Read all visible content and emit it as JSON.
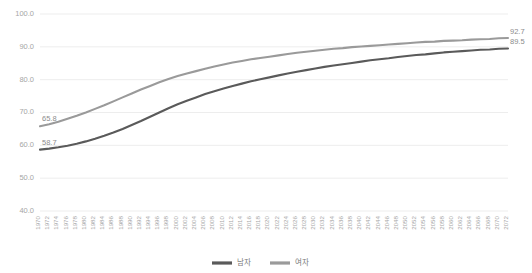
{
  "chart_data": {
    "type": "line",
    "title": "",
    "xlabel": "",
    "ylabel": "",
    "grid": true,
    "legend_position": "bottom-center",
    "ylim": [
      40.0,
      100.0
    ],
    "ytick_labels": [
      "100.0",
      "90.0",
      "80.0",
      "70.0",
      "60.0",
      "50.0",
      "40.0"
    ],
    "ytick_values": [
      100.0,
      90.0,
      80.0,
      70.0,
      60.0,
      50.0,
      40.0
    ],
    "xlim": [
      1970,
      2072
    ],
    "x": [
      1970,
      1972,
      1974,
      1976,
      1978,
      1980,
      1982,
      1984,
      1986,
      1988,
      1990,
      1992,
      1994,
      1996,
      1998,
      2000,
      2002,
      2004,
      2006,
      2008,
      2010,
      2012,
      2014,
      2016,
      2018,
      2020,
      2022,
      2024,
      2026,
      2028,
      2030,
      2032,
      2034,
      2036,
      2038,
      2040,
      2042,
      2044,
      2046,
      2048,
      2050,
      2052,
      2054,
      2056,
      2058,
      2060,
      2062,
      2064,
      2066,
      2068,
      2070,
      2072
    ],
    "xtick_labels": [
      "1970",
      "1972",
      "1974",
      "1976",
      "1978",
      "1980",
      "1982",
      "1984",
      "1986",
      "1988",
      "1990",
      "1992",
      "1994",
      "1996",
      "1998",
      "2000",
      "2002",
      "2004",
      "2006",
      "2008",
      "2010",
      "2012",
      "2014",
      "2016",
      "2018",
      "2020",
      "2022",
      "2024",
      "2026",
      "2028",
      "2030",
      "2032",
      "2034",
      "2036",
      "2038",
      "2040",
      "2042",
      "2044",
      "2046",
      "2048",
      "2050",
      "2052",
      "2054",
      "2056",
      "2058",
      "2060",
      "2062",
      "2064",
      "2066",
      "2068",
      "2070",
      "2072"
    ],
    "series": [
      {
        "name": "여자",
        "color": "#9a9a9a",
        "start_label": "65.8",
        "end_label": "92.7",
        "values": [
          65.8,
          66.4,
          67.2,
          68.1,
          69.0,
          70.0,
          71.1,
          72.2,
          73.4,
          74.6,
          75.8,
          77.0,
          78.1,
          79.2,
          80.2,
          81.1,
          81.9,
          82.6,
          83.3,
          84.0,
          84.6,
          85.2,
          85.7,
          86.2,
          86.6,
          87.0,
          87.4,
          87.8,
          88.2,
          88.5,
          88.8,
          89.1,
          89.4,
          89.6,
          89.9,
          90.1,
          90.3,
          90.5,
          90.7,
          90.9,
          91.1,
          91.3,
          91.5,
          91.6,
          91.8,
          91.9,
          92.0,
          92.2,
          92.3,
          92.4,
          92.6,
          92.7
        ]
      },
      {
        "name": "남자",
        "color": "#5a5a5a",
        "start_label": "58.7",
        "end_label": "89.5",
        "values": [
          58.7,
          59.0,
          59.4,
          59.9,
          60.5,
          61.2,
          62.0,
          62.9,
          63.9,
          65.0,
          66.2,
          67.4,
          68.7,
          70.0,
          71.3,
          72.5,
          73.6,
          74.6,
          75.6,
          76.5,
          77.3,
          78.1,
          78.8,
          79.5,
          80.1,
          80.7,
          81.3,
          81.9,
          82.4,
          82.9,
          83.4,
          83.9,
          84.3,
          84.7,
          85.1,
          85.5,
          85.9,
          86.2,
          86.5,
          86.9,
          87.2,
          87.5,
          87.7,
          88.0,
          88.3,
          88.5,
          88.7,
          88.9,
          89.1,
          89.2,
          89.4,
          89.5
        ]
      }
    ],
    "annotations": [
      {
        "text": "65.8",
        "series": "여자",
        "position": "left-start"
      },
      {
        "text": "58.7",
        "series": "남자",
        "position": "left-start"
      },
      {
        "text": "92.7",
        "series": "여자",
        "position": "right-end"
      },
      {
        "text": "89.5",
        "series": "남자",
        "position": "right-end"
      }
    ],
    "legend": [
      {
        "label": "남자",
        "color": "#5a5a5a"
      },
      {
        "label": "여자",
        "color": "#9a9a9a"
      }
    ]
  }
}
